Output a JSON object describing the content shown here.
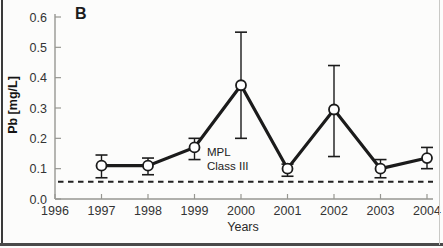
{
  "figure": {
    "panel_label": "B"
  },
  "chart_data": {
    "type": "line",
    "title": "",
    "xlabel": "Years",
    "ylabel": "Pb [mg/L]",
    "x": [
      1997,
      1998,
      1999,
      2000,
      2001,
      2002,
      2003,
      2004
    ],
    "series": [
      {
        "name": "Pb concentration",
        "values": [
          0.11,
          0.11,
          0.17,
          0.375,
          0.1,
          0.295,
          0.1,
          0.135
        ],
        "err_low": [
          0.04,
          0.03,
          0.04,
          0.175,
          0.025,
          0.155,
          0.03,
          0.035
        ],
        "err_high": [
          0.035,
          0.025,
          0.03,
          0.175,
          0.015,
          0.145,
          0.03,
          0.035
        ]
      }
    ],
    "xticks": [
      1996,
      1997,
      1998,
      1999,
      2000,
      2001,
      2002,
      2003,
      2004
    ],
    "yticks": [
      0.0,
      0.1,
      0.2,
      0.3,
      0.4,
      0.5,
      0.6
    ],
    "xlim": [
      1996,
      2004
    ],
    "ylim": [
      0,
      0.6
    ],
    "grid": "off",
    "legend": "none",
    "reference_line": {
      "value": 0.057,
      "style": "dashed",
      "label_lines": [
        "MPL",
        "Class III"
      ]
    },
    "colors": {
      "line": "#1b1b1b",
      "marker_fill": "#ffffff",
      "marker_stroke": "#1b1b1b",
      "error_bar": "#1b1b1b",
      "reference_line": "#222222",
      "axis": "#979792",
      "tick_text": "#333333"
    }
  }
}
